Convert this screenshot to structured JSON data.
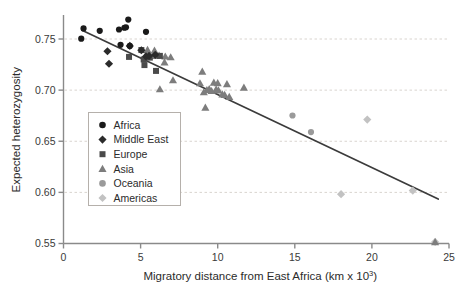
{
  "chart_data": {
    "type": "scatter",
    "title": "",
    "xlabel": "Migratory distance from East Africa (km x 10",
    "xlabel_sup": "3",
    "xlabel_tail": ")",
    "ylabel": "Expected heterozygosity",
    "xlim": [
      0,
      25
    ],
    "ylim": [
      0.55,
      0.7725
    ],
    "xticks": [
      0,
      5,
      10,
      15,
      20,
      25
    ],
    "xtick_labels": [
      "0",
      "5",
      "10",
      "15",
      "20",
      "25"
    ],
    "yticks": [
      0.55,
      0.6,
      0.65,
      0.7,
      0.75
    ],
    "ytick_labels": [
      "0.55",
      "0.60",
      "0.65",
      "0.70",
      "0.75"
    ],
    "grid": "horizontal-dashed",
    "grid_color": "#d9d4cf",
    "legend_position": "center-left",
    "trendline": {
      "name": "linear fit",
      "x": [
        1.2,
        24.3
      ],
      "y": [
        0.7585,
        0.5935
      ],
      "color": "#3b3b3b",
      "width": 1.7
    },
    "series": [
      {
        "name": "Africa",
        "marker": "circle",
        "color": "#1a1a1a",
        "size": 6.2,
        "points": [
          [
            1.15,
            0.7503
          ],
          [
            1.3,
            0.7603
          ],
          [
            2.35,
            0.758
          ],
          [
            3.6,
            0.7593
          ],
          [
            3.7,
            0.7443
          ],
          [
            3.95,
            0.761
          ],
          [
            4.05,
            0.7615
          ],
          [
            4.2,
            0.769
          ],
          [
            4.3,
            0.7432
          ],
          [
            5.35,
            0.757
          ]
        ]
      },
      {
        "name": "Middle East",
        "marker": "diamond",
        "color": "#2b2b2b",
        "size": 6.6,
        "points": [
          [
            2.85,
            0.738
          ],
          [
            2.95,
            0.7258
          ],
          [
            4.3,
            0.7432
          ],
          [
            5.05,
            0.739
          ],
          [
            5.35,
            0.733
          ],
          [
            5.55,
            0.7335
          ],
          [
            5.95,
            0.7345
          ]
        ]
      },
      {
        "name": "Europe",
        "marker": "square",
        "color": "#4a4a4a",
        "size": 6.0,
        "points": [
          [
            4.25,
            0.7325
          ],
          [
            5.05,
            0.7392
          ],
          [
            5.2,
            0.73
          ],
          [
            5.25,
            0.7245
          ],
          [
            5.45,
            0.733
          ],
          [
            5.6,
            0.7318
          ],
          [
            6.0,
            0.7188
          ],
          [
            6.25,
            0.7335
          ]
        ]
      },
      {
        "name": "Asia",
        "marker": "triangle",
        "color": "#7d7d7d",
        "size": 6.6,
        "points": [
          [
            5.45,
            0.7395
          ],
          [
            5.9,
            0.7388
          ],
          [
            6.0,
            0.7335
          ],
          [
            6.2,
            0.734
          ],
          [
            6.25,
            0.701
          ],
          [
            6.55,
            0.7272
          ],
          [
            6.6,
            0.733
          ],
          [
            6.95,
            0.7322
          ],
          [
            7.1,
            0.7098
          ],
          [
            8.85,
            0.7068
          ],
          [
            9.0,
            0.7182
          ],
          [
            9.1,
            0.698
          ],
          [
            9.2,
            0.683
          ],
          [
            9.3,
            0.7002
          ],
          [
            9.45,
            0.7012
          ],
          [
            9.6,
            0.6992
          ],
          [
            9.75,
            0.7075
          ],
          [
            9.9,
            0.7008
          ],
          [
            10.0,
            0.707
          ],
          [
            10.05,
            0.6998
          ],
          [
            10.3,
            0.696
          ],
          [
            10.45,
            0.6955
          ],
          [
            10.6,
            0.706
          ],
          [
            10.75,
            0.6935
          ],
          [
            11.7,
            0.7025
          ],
          [
            24.1,
            0.5515
          ]
        ]
      },
      {
        "name": "Oceania",
        "marker": "circle",
        "color": "#9a9a9a",
        "size": 6.2,
        "points": [
          [
            14.85,
            0.6752
          ],
          [
            16.05,
            0.659
          ]
        ]
      },
      {
        "name": "Americas",
        "marker": "diamond",
        "color": "#c2c2c2",
        "size": 6.6,
        "points": [
          [
            18.0,
            0.5982
          ],
          [
            19.7,
            0.6712
          ],
          [
            22.65,
            0.6018
          ],
          [
            24.1,
            0.5515
          ]
        ]
      }
    ]
  },
  "legend": {
    "items": [
      {
        "label": "Africa",
        "marker": "circle",
        "color": "#1a1a1a"
      },
      {
        "label": "Middle East",
        "marker": "diamond",
        "color": "#2b2b2b"
      },
      {
        "label": "Europe",
        "marker": "square",
        "color": "#4a4a4a"
      },
      {
        "label": "Asia",
        "marker": "triangle",
        "color": "#7d7d7d"
      },
      {
        "label": "Oceania",
        "marker": "circle",
        "color": "#9a9a9a"
      },
      {
        "label": "Americas",
        "marker": "diamond",
        "color": "#c2c2c2"
      }
    ],
    "border_color": "#b5b0ab",
    "background": "#ffffff"
  },
  "style": {
    "axis_color": "#8a8a8a",
    "text_color": "#2b2b2b",
    "background": "#ffffff"
  }
}
